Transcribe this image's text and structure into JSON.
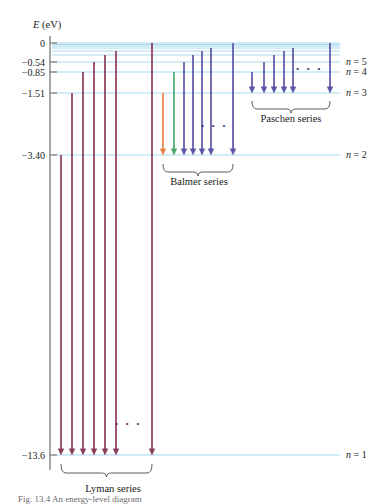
{
  "figure": {
    "axis": {
      "label": "E",
      "label_unit": "(eV)",
      "ticks": [
        {
          "value": 0,
          "text": "0",
          "y": 43
        },
        {
          "value": -0.54,
          "text": "−0.54",
          "y": 62
        },
        {
          "value": -0.85,
          "text": "−0.85",
          "y": 72
        },
        {
          "value": -1.51,
          "text": "−1.51",
          "y": 93
        },
        {
          "value": -3.4,
          "text": "−3.40",
          "y": 155
        },
        {
          "value": -13.6,
          "text": "−13.6",
          "y": 455
        }
      ]
    },
    "level_lines": [
      {
        "n": 1,
        "label": "n = 1",
        "y": 455,
        "show_label": true
      },
      {
        "n": 2,
        "label": "n = 2",
        "y": 155,
        "show_label": true
      },
      {
        "n": 3,
        "label": "n = 3",
        "y": 93,
        "show_label": true
      },
      {
        "n": 4,
        "label": "n = 4",
        "y": 72,
        "show_label": true
      },
      {
        "n": 5,
        "label": "n = 5",
        "y": 62,
        "show_label": true
      },
      {
        "n": 6,
        "label": "",
        "y": 55,
        "show_label": false
      },
      {
        "n": 7,
        "label": "",
        "y": 51,
        "show_label": false
      },
      {
        "n": 8,
        "label": "",
        "y": 48,
        "show_label": false
      },
      {
        "n": 9,
        "label": "",
        "y": 46,
        "show_label": false
      },
      {
        "n": 10,
        "label": "",
        "y": 44.5,
        "show_label": false
      },
      {
        "n": 11,
        "label": "",
        "y": 43,
        "show_label": false
      }
    ],
    "series": [
      {
        "name": "Lyman series",
        "label_x": 113,
        "label_y": 492,
        "bracket": {
          "x1": 61,
          "x2": 152,
          "y": 464,
          "tip_y": 474
        },
        "target_y": 455,
        "dots": {
          "x": 128,
          "y": 428,
          "text": "· · ·"
        },
        "color": "#8c3a5e",
        "arrows": [
          {
            "x": 61,
            "from_y": 155,
            "label": "n=2 → 1"
          },
          {
            "x": 72,
            "from_y": 93,
            "label": "n=3 → 1"
          },
          {
            "x": 83,
            "from_y": 72,
            "label": "n=4 → 1"
          },
          {
            "x": 94,
            "from_y": 62,
            "label": "n=5 → 1"
          },
          {
            "x": 105,
            "from_y": 55,
            "label": "n=6 → 1"
          },
          {
            "x": 116,
            "from_y": 51,
            "label": "n=7 → 1"
          },
          {
            "x": 152,
            "from_y": 43,
            "label": "n=∞ → 1"
          }
        ]
      },
      {
        "name": "Balmer series",
        "label_x": 199,
        "label_y": 185,
        "bracket": {
          "x1": 163,
          "x2": 233,
          "y": 164,
          "tip_y": 173
        },
        "target_y": 155,
        "dots": {
          "x": 214,
          "y": 130,
          "text": "· · ·"
        },
        "arrows": [
          {
            "x": 163,
            "from_y": 93,
            "color": "#e8834a",
            "label": "n=3 → 2 (H-alpha, red)"
          },
          {
            "x": 174,
            "from_y": 72,
            "color": "#4aa86c",
            "label": "n=4 → 2 (H-beta, green)"
          },
          {
            "x": 184,
            "from_y": 62,
            "color": "#5b55a8",
            "label": "n=5 → 2 (H-gamma, violet)"
          },
          {
            "x": 193,
            "from_y": 55,
            "color": "#5b55a8",
            "label": "n=6 → 2"
          },
          {
            "x": 202,
            "from_y": 51,
            "color": "#5b55a8",
            "label": "n=7 → 2"
          },
          {
            "x": 211,
            "from_y": 48,
            "color": "#5b55a8",
            "label": "n=8 → 2"
          },
          {
            "x": 233,
            "from_y": 43,
            "color": "#5b55a8",
            "label": "n=∞ → 2"
          }
        ]
      },
      {
        "name": "Paschen series",
        "label_x": 291,
        "label_y": 122,
        "bracket": {
          "x1": 252,
          "x2": 330,
          "y": 101,
          "tip_y": 110
        },
        "target_y": 93,
        "dots": {
          "x": 309,
          "y": 73,
          "text": "· · ·"
        },
        "color": "#5b55a8",
        "arrows": [
          {
            "x": 252,
            "from_y": 72,
            "label": "n=4 → 3"
          },
          {
            "x": 264,
            "from_y": 62,
            "label": "n=5 → 3"
          },
          {
            "x": 274,
            "from_y": 55,
            "label": "n=6 → 3"
          },
          {
            "x": 284,
            "from_y": 51,
            "label": "n=7 → 3"
          },
          {
            "x": 293,
            "from_y": 48,
            "label": "n=8 → 3"
          },
          {
            "x": 330,
            "from_y": 43,
            "label": "n=∞ → 3"
          }
        ]
      }
    ],
    "colors": {
      "level_line": "#a9d9ef",
      "axis": "#6f6f6f",
      "lyman_arrow": "#8c3a5e",
      "balmer_red": "#e8834a",
      "balmer_green": "#4aa86c",
      "balmer_violet": "#5b55a8",
      "paschen_arrow": "#5b55a8",
      "text": "#1a1a1a"
    },
    "geometry": {
      "axis_x": 50,
      "plot_right": 345,
      "level_start_x": 52,
      "level_end_x": 340
    },
    "caption": "Fig. 13.4  An energy-level diagram"
  }
}
